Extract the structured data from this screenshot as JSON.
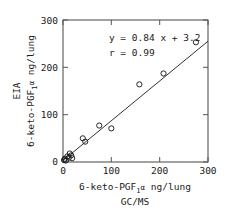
{
  "chart_data": {
    "type": "scatter",
    "title": "",
    "xlabel": "6-keto-PGF1α ng/lung",
    "xlabel_line2": "GC/MS",
    "ylabel": "EIA",
    "ylabel_line2": "6-keto-PGF1α ng/lung",
    "xlim": [
      0,
      300
    ],
    "ylim": [
      0,
      300
    ],
    "xticks": [
      0,
      100,
      200,
      300
    ],
    "yticks": [
      0,
      100,
      200,
      300
    ],
    "xtick_labels": [
      "0",
      "100",
      "200",
      "300"
    ],
    "ytick_labels": [
      "0",
      "100",
      "200",
      "300"
    ],
    "grid": false,
    "legend": false,
    "marker": "open-circle",
    "marker_color": "#1a1a1a",
    "line_color": "#1a1a1a",
    "annotations": [
      {
        "text": "y = 0.84 x + 3.2",
        "x": 95,
        "y": 255
      },
      {
        "text": "r = 0.99",
        "x": 95,
        "y": 225
      }
    ],
    "fit": {
      "slope": 0.84,
      "intercept": 3.2,
      "r": 0.99,
      "equation": "y = 0.84 x + 3.2",
      "correlation": "r = 0.99",
      "x_start": 0,
      "x_end": 300
    },
    "points": [
      {
        "x": 2,
        "y": 4
      },
      {
        "x": 4,
        "y": 7
      },
      {
        "x": 6,
        "y": 3
      },
      {
        "x": 9,
        "y": 12
      },
      {
        "x": 12,
        "y": 9
      },
      {
        "x": 14,
        "y": 18
      },
      {
        "x": 17,
        "y": 14
      },
      {
        "x": 19,
        "y": 8
      },
      {
        "x": 41,
        "y": 50
      },
      {
        "x": 46,
        "y": 43
      },
      {
        "x": 75,
        "y": 77
      },
      {
        "x": 100,
        "y": 71
      },
      {
        "x": 158,
        "y": 164
      },
      {
        "x": 208,
        "y": 187
      },
      {
        "x": 275,
        "y": 253
      }
    ]
  },
  "axis_subscript": {
    "base": "6-keto-PGF",
    "sub": "1",
    "greek": "α",
    "units": " ng/lung"
  }
}
